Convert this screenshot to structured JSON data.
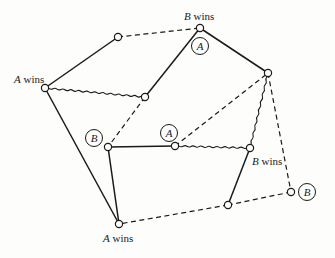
{
  "diagram": {
    "type": "game-graph",
    "nodes": [
      {
        "id": "n1",
        "x": 118,
        "y": 37
      },
      {
        "id": "n2",
        "x": 200,
        "y": 28,
        "label": {
          "player": "B",
          "text": " wins",
          "lx": 184,
          "ly": 18
        },
        "marker": {
          "text": "A",
          "cx": 200,
          "cy": 46
        }
      },
      {
        "id": "n3",
        "x": 45,
        "y": 88,
        "label": {
          "player": "A",
          "text": " wins",
          "lx": 16,
          "ly": 81
        }
      },
      {
        "id": "n4",
        "x": 145,
        "y": 97
      },
      {
        "id": "n5",
        "x": 268,
        "y": 73
      },
      {
        "id": "n6",
        "x": 108,
        "y": 147,
        "marker": {
          "text": "B",
          "cx": 94,
          "cy": 138
        }
      },
      {
        "id": "n7",
        "x": 175,
        "y": 146,
        "marker": {
          "text": "A",
          "cx": 169,
          "cy": 133
        }
      },
      {
        "id": "n8",
        "x": 250,
        "y": 148,
        "label": {
          "player": "B",
          "text": " wins",
          "lx": 252,
          "ly": 164
        }
      },
      {
        "id": "n9",
        "x": 291,
        "y": 192,
        "marker": {
          "text": "B",
          "cx": 307,
          "cy": 192
        }
      },
      {
        "id": "n10",
        "x": 228,
        "y": 205
      },
      {
        "id": "n11",
        "x": 119,
        "y": 224,
        "label": {
          "player": "A",
          "text": " wins",
          "lx": 103,
          "ly": 241
        }
      }
    ],
    "edges": [
      {
        "from": "n1",
        "to": "n2",
        "style": "dashed"
      },
      {
        "from": "n1",
        "to": "n3",
        "style": "solid"
      },
      {
        "from": "n2",
        "to": "n4",
        "style": "solid"
      },
      {
        "from": "n2",
        "to": "n5",
        "style": "solid"
      },
      {
        "from": "n3",
        "to": "n4",
        "style": "wavy"
      },
      {
        "from": "n3",
        "to": "n11",
        "style": "solid"
      },
      {
        "from": "n4",
        "to": "n6",
        "style": "dashed"
      },
      {
        "from": "n6",
        "to": "n7",
        "style": "solid"
      },
      {
        "from": "n6",
        "to": "n11",
        "style": "solid"
      },
      {
        "from": "n7",
        "to": "n5",
        "style": "dashed"
      },
      {
        "from": "n7",
        "to": "n8",
        "style": "wavy"
      },
      {
        "from": "n5",
        "to": "n8",
        "style": "wavy"
      },
      {
        "from": "n5",
        "to": "n9",
        "style": "dashed"
      },
      {
        "from": "n8",
        "to": "n10",
        "style": "solid"
      },
      {
        "from": "n10",
        "to": "n11",
        "style": "dashed"
      },
      {
        "from": "n9",
        "to": "n10",
        "style": "dashed"
      }
    ]
  },
  "labels": {
    "b_wins_top": "B",
    "a_wins_left": "A",
    "b_wins_right": "B",
    "a_wins_bottom": "A",
    "wins": " wins"
  },
  "markers": {
    "top_a": "A",
    "left_b": "B",
    "mid_a": "A",
    "right_b": "B"
  }
}
